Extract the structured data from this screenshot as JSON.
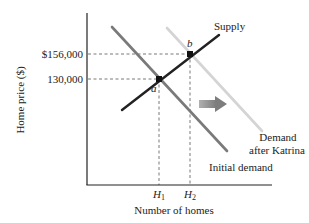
{
  "diagram": {
    "title": "",
    "y_axis_label": "Home price ($)",
    "x_axis_label": "Number of homes",
    "y_ticks": [
      {
        "label": "$156,000",
        "y": 54
      },
      {
        "label": "130,000",
        "y": 79
      }
    ],
    "x_ticks": [
      {
        "label": "H",
        "sub": "1",
        "x": 159
      },
      {
        "label": "H",
        "sub": "2",
        "x": 190
      }
    ],
    "points": [
      {
        "label": "a",
        "x": 159,
        "y": 79
      },
      {
        "label": "b",
        "x": 190,
        "y": 54
      }
    ],
    "curves": {
      "supply": {
        "label": "Supply",
        "color": "#222222"
      },
      "initial_demand": {
        "label": "Initial demand",
        "color": "#7a7a7a"
      },
      "demand_after": {
        "label_line1": "Demand",
        "label_line2": "after Katrina",
        "color": "#d4d4d4"
      }
    },
    "shift_arrow": {
      "direction": "right",
      "color": "#8a8a8a"
    }
  }
}
